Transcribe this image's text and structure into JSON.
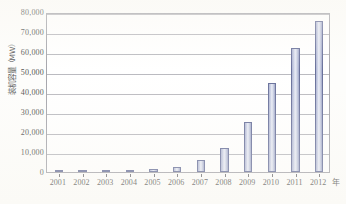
{
  "chart_data": {
    "type": "bar",
    "title": "",
    "xlabel": "年",
    "ylabel": "装机容量（MW）",
    "categories": [
      "2001",
      "2002",
      "2003",
      "2004",
      "2005",
      "2006",
      "2007",
      "2008",
      "2009",
      "2010",
      "2011",
      "2012"
    ],
    "values": [
      400,
      470,
      570,
      760,
      1270,
      2600,
      5900,
      12200,
      25000,
      44700,
      62000,
      75300
    ],
    "series": [
      {
        "name": "装机容量",
        "values": [
          400,
          470,
          570,
          760,
          1270,
          2600,
          5900,
          12200,
          25000,
          44700,
          62000,
          75300
        ]
      }
    ],
    "ylim": [
      0,
      80000
    ],
    "ytick_step": 10000,
    "ytick_labels": [
      "80,000",
      "70,000",
      "60,000",
      "50,000",
      "40,000",
      "30,000",
      "20,000",
      "10,000",
      "0"
    ],
    "ytick_values": [
      80000,
      70000,
      60000,
      50000,
      40000,
      30000,
      20000,
      10000,
      0
    ],
    "grid": true,
    "legend": "none",
    "bar_fill_color": "#c3c9e2",
    "bar_edge_color": "#434d82",
    "gridline_color": "#a9a9b0",
    "frame_color": "#8e8e96",
    "background_color": "#ffffff"
  },
  "axes": {
    "y_axis_title": "装机容量（MW）",
    "x_axis_unit": "年"
  }
}
